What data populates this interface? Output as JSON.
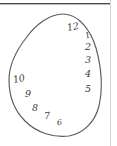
{
  "figure": {
    "ink_color": "#3a3a3a",
    "outline_color": "#5a5a5a",
    "background_color": "#ffffff",
    "rule_color": "#4a4a4a",
    "side_rule_color": "#d2d2d2"
  },
  "clock": {
    "numerals": [
      {
        "label": "12",
        "left": 67,
        "top": 22,
        "rotate": -12,
        "size": "n-big"
      },
      {
        "label": "1",
        "left": 85,
        "top": 31,
        "rotate": -18,
        "size": "n-small"
      },
      {
        "label": "2",
        "left": 85,
        "top": 42,
        "rotate": 0,
        "size": "n-big"
      },
      {
        "label": "3",
        "left": 85,
        "top": 55,
        "rotate": 0,
        "size": "n-big"
      },
      {
        "label": "4",
        "left": 85,
        "top": 69,
        "rotate": 0,
        "size": "n-big"
      },
      {
        "label": "5",
        "left": 85,
        "top": 84,
        "rotate": 0,
        "size": "n-big"
      },
      {
        "label": "6",
        "left": 57,
        "top": 118,
        "rotate": -12,
        "size": "n-small"
      },
      {
        "label": "7",
        "left": 44,
        "top": 111,
        "rotate": -6,
        "size": "n-big"
      },
      {
        "label": "8",
        "left": 32,
        "top": 103,
        "rotate": 0,
        "size": "n-big"
      },
      {
        "label": "9",
        "left": 25,
        "top": 89,
        "rotate": 0,
        "size": "n-big"
      },
      {
        "label": "10",
        "left": 13,
        "top": 74,
        "rotate": -12,
        "size": "n-big"
      }
    ],
    "numeral_sequence": "12 1 2 3 4 5 6 7 8 9 10",
    "missing_numerals": "11",
    "outline_path": "M 63 14 C 50 14, 36 24, 26 38 C 16 51, 9 66, 9 80 C 9 95, 14 110, 25 121 C 37 133, 54 138, 69 136 C 84 133, 95 122, 99 106 C 103 88, 101 66, 96 48 C 91 31, 79 14, 63 14 Z"
  }
}
